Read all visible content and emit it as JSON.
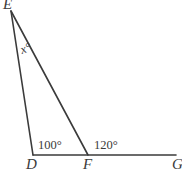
{
  "figure": {
    "background_color": "#ffffff",
    "stroke_color": "#3b3b3b",
    "text_color": "#3b3b3b"
  },
  "vertices": {
    "E": {
      "label": "E",
      "x": 11,
      "y": 11,
      "label_x": 3,
      "label_y": 9
    },
    "D": {
      "label": "D",
      "x": 33,
      "y": 155,
      "label_x": 26,
      "label_y": 169
    },
    "F": {
      "label": "F",
      "x": 88,
      "y": 155,
      "label_x": 83,
      "label_y": 169
    },
    "G": {
      "label": "G",
      "x": 176,
      "y": 155,
      "label_x": 172,
      "label_y": 169
    }
  },
  "segments": [
    {
      "name": "segment-ED",
      "from": "E",
      "to": "D",
      "x1": 11,
      "y1": 11,
      "x2": 33,
      "y2": 155
    },
    {
      "name": "segment-EF",
      "from": "E",
      "to": "F",
      "x1": 11,
      "y1": 11,
      "x2": 88,
      "y2": 155
    },
    {
      "name": "segment-DG",
      "from": "D",
      "to": "G",
      "x1": 33,
      "y1": 155,
      "x2": 176,
      "y2": 155
    }
  ],
  "angles": [
    {
      "name": "angle-at-E",
      "label": "x°",
      "vertex": "E",
      "label_x": 22,
      "label_y": 54,
      "rotation": -20,
      "unknown": true
    },
    {
      "name": "angle-at-D",
      "label": "100°",
      "vertex": "D",
      "label_x": 38,
      "label_y": 149,
      "value": 100
    },
    {
      "name": "angle-at-F",
      "label": "120°",
      "vertex": "F",
      "label_x": 94,
      "label_y": 149,
      "value": 120
    }
  ]
}
